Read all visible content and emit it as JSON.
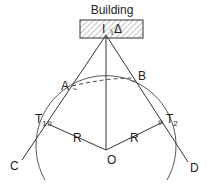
{
  "title": "Building",
  "labels": {
    "I": "I",
    "delta": "Δ",
    "A": "A",
    "B": "B",
    "T1": "T",
    "T1_sub": "1",
    "T2": "T",
    "T2_sub": "2",
    "R_left": "R",
    "R_right": "R",
    "O": "O",
    "C": "C",
    "D": "D"
  }
}
